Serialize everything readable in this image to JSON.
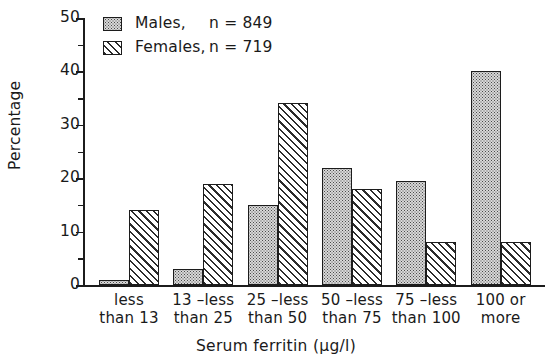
{
  "chart_data": {
    "type": "bar",
    "title": "",
    "xlabel": "Serum ferritin (µg/l)",
    "ylabel": "Percentage",
    "ylim": [
      0,
      50
    ],
    "ytick_step": 10,
    "yminor_step": 5,
    "grid": false,
    "legend_position": "top-left",
    "yticks": [
      "0",
      "10",
      "20",
      "30",
      "40",
      "50"
    ],
    "categories": [
      [
        "less",
        "than 13"
      ],
      [
        "13 –less",
        "than 25"
      ],
      [
        "25 –less",
        "than 50"
      ],
      [
        "50 –less",
        "than 75"
      ],
      [
        "75 –less",
        "than 100"
      ],
      [
        "100 or",
        "more"
      ]
    ],
    "category_labels": [
      "less than 13",
      "13 –less than 25",
      "25 –less than 50",
      "50 –less than 75",
      "75 –less than 100",
      "100 or more"
    ],
    "series": [
      {
        "name": "Males",
        "legend_label": "Males,",
        "n_label": "n = 849",
        "n": 849,
        "pattern": "dotted",
        "values": [
          1,
          3,
          15,
          22,
          19.5,
          40
        ]
      },
      {
        "name": "Females",
        "legend_label": "Females,",
        "n_label": "n = 719",
        "n": 719,
        "pattern": "diagonal-hatch",
        "values": [
          14,
          19,
          34,
          18,
          8,
          8
        ]
      }
    ]
  },
  "colors": {
    "axis": "#1c1c1c",
    "males_fill": "#d8d8d8",
    "females_fill": "#ffffff",
    "text": "#1a1a1a"
  }
}
